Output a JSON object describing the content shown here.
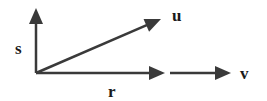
{
  "diagram": {
    "stroke_color": "#3a3a3a",
    "vectors": [
      {
        "name": "s",
        "label": "s",
        "x1": 36,
        "y1": 73,
        "x2": 36,
        "y2": 8,
        "lx": 15,
        "ly": 54
      },
      {
        "name": "u",
        "label": "u",
        "x1": 36,
        "y1": 73,
        "x2": 161,
        "y2": 19,
        "lx": 172,
        "ly": 21
      },
      {
        "name": "r",
        "label": "r",
        "x1": 36,
        "y1": 73,
        "x2": 165,
        "y2": 73,
        "lx": 108,
        "ly": 97
      },
      {
        "name": "v",
        "label": "v",
        "x1": 170,
        "y1": 73,
        "x2": 231,
        "y2": 73,
        "lx": 240,
        "ly": 79
      }
    ]
  }
}
